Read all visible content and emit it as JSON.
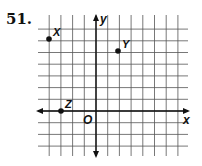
{
  "problem": {
    "number": "51.",
    "axes": {
      "x_label": "x",
      "y_label": "y",
      "origin_label": "O"
    },
    "grid": {
      "x_min": -4,
      "x_max": 7,
      "y_min": -3,
      "y_max": 7
    },
    "points": [
      {
        "name": "X",
        "x": -4,
        "y": 6
      },
      {
        "name": "Y",
        "x": 2,
        "y": 5
      },
      {
        "name": "Z",
        "x": -3,
        "y": 0
      }
    ]
  }
}
